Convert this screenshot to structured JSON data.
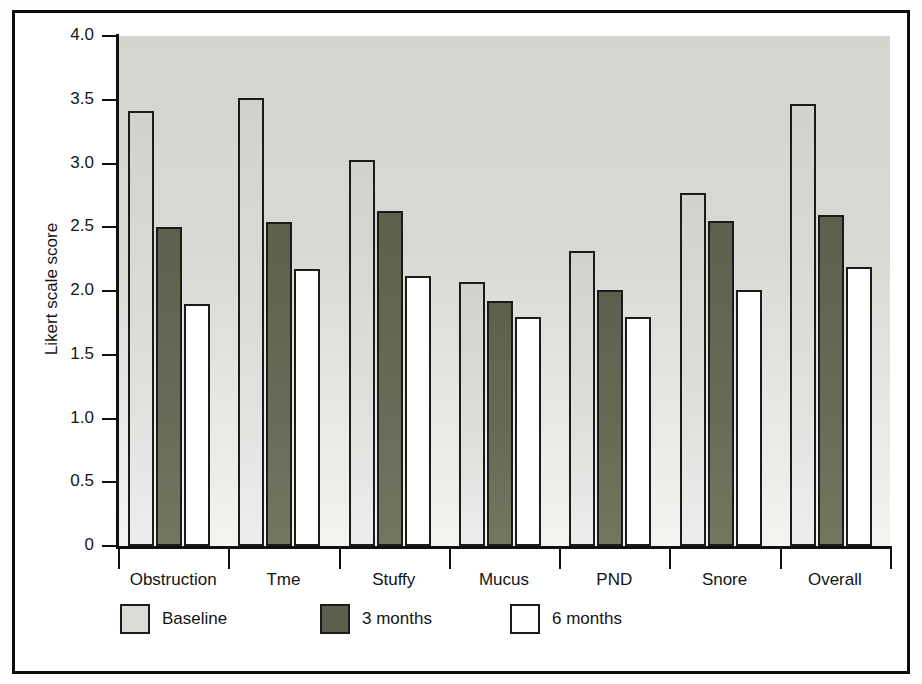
{
  "chart_data": {
    "type": "bar",
    "title": "",
    "xlabel": "",
    "ylabel": "Likert scale score",
    "ylim": [
      0,
      4.0
    ],
    "ytick_labels": [
      "0",
      "0.5",
      "1.0",
      "1.5",
      "2.0",
      "2.5",
      "3.0",
      "3.5",
      "4.0"
    ],
    "ytick_values": [
      0,
      0.5,
      1.0,
      1.5,
      2.0,
      2.5,
      3.0,
      3.5,
      4.0
    ],
    "grid": false,
    "legend_position": "bottom-left",
    "categories": [
      "Obstruction",
      "Tme",
      "Stuffy",
      "Mucus",
      "PND",
      "Snore",
      "Overall"
    ],
    "series": [
      {
        "name": "Baseline",
        "color": "#dcdcd6",
        "values": [
          3.41,
          3.51,
          3.03,
          2.07,
          2.31,
          2.77,
          3.47
        ]
      },
      {
        "name": "3 months",
        "color": "#5e5f4c",
        "values": [
          2.5,
          2.54,
          2.63,
          1.92,
          2.01,
          2.55,
          2.6
        ]
      },
      {
        "name": "6 months",
        "color": "#ffffff",
        "values": [
          1.9,
          2.17,
          2.12,
          1.8,
          1.8,
          2.01,
          2.19
        ]
      }
    ]
  },
  "colors": {
    "plot_background": "#d8dad4",
    "axis": "#111111",
    "bar_outline": "#1b1b1b",
    "frame": "#0d0d0d"
  }
}
